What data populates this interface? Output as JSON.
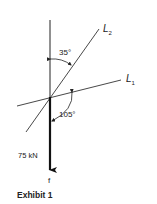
{
  "diagram": {
    "lines": {
      "L2": {
        "label": "L",
        "subscript": "2"
      },
      "L1": {
        "label": "L",
        "subscript": "1"
      }
    },
    "angles": {
      "vertical_to_L2": "35°",
      "L1_to_force": "105°"
    },
    "force": {
      "magnitude": "75 kN",
      "name": "f"
    },
    "caption": "Exhibit 1"
  }
}
